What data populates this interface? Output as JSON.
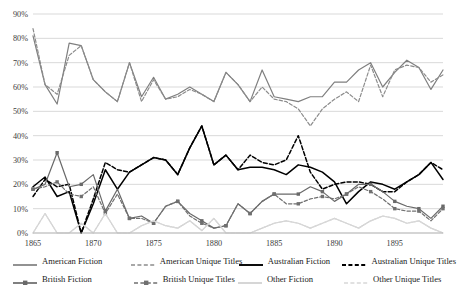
{
  "chart_data": {
    "type": "line",
    "title": "",
    "subtitle": "",
    "xlabel": "",
    "ylabel": "",
    "xlim": [
      1865,
      1899
    ],
    "ylim": [
      0,
      90
    ],
    "grid": true,
    "gridlines": "horizontal",
    "legend_position": "bottom",
    "y_ticks": [
      "0%",
      "10%",
      "20%",
      "30%",
      "40%",
      "50%",
      "60%",
      "70%",
      "80%",
      "90%"
    ],
    "y_tick_values": [
      0,
      10,
      20,
      30,
      40,
      50,
      60,
      70,
      80,
      90
    ],
    "x_ticks": [
      "1865",
      "1870",
      "1875",
      "1880",
      "1885",
      "1890",
      "1895"
    ],
    "x_tick_values": [
      1865,
      1870,
      1875,
      1880,
      1885,
      1890,
      1895
    ],
    "x": [
      1865,
      1866,
      1867,
      1868,
      1869,
      1870,
      1871,
      1872,
      1873,
      1874,
      1875,
      1876,
      1877,
      1878,
      1879,
      1880,
      1881,
      1882,
      1883,
      1884,
      1885,
      1886,
      1887,
      1888,
      1889,
      1890,
      1891,
      1892,
      1893,
      1894,
      1895,
      1896,
      1897,
      1898,
      1899
    ],
    "series": [
      {
        "name": "American Fiction",
        "color": "#7f7f7f",
        "style": "solid",
        "marker": "none",
        "values": [
          81,
          61,
          53,
          78,
          77,
          63,
          58,
          54,
          70,
          56,
          64,
          55,
          57,
          60,
          57,
          54,
          66,
          61,
          54,
          67,
          56,
          55,
          54,
          56,
          56,
          62,
          62,
          67,
          70,
          60,
          66,
          71,
          68,
          59,
          67
        ]
      },
      {
        "name": "American Unique Titles",
        "color": "#8c8c8c",
        "style": "dashed",
        "marker": "none",
        "values": [
          84,
          61,
          57,
          73,
          77,
          63,
          58,
          54,
          70,
          54,
          63,
          55,
          56,
          59,
          57,
          54,
          66,
          61,
          54,
          60,
          55,
          54,
          51,
          44,
          51,
          55,
          58,
          54,
          69,
          56,
          67,
          69,
          68,
          62,
          65
        ]
      },
      {
        "name": "Australian Fiction",
        "color": "#000000",
        "style": "solid",
        "marker": "none",
        "values": [
          19,
          23,
          15,
          17,
          0,
          12,
          26,
          18,
          25,
          28,
          31,
          30,
          24,
          35,
          44,
          28,
          32,
          26,
          27,
          27,
          26,
          24,
          28,
          27,
          25,
          21,
          12,
          17,
          21,
          20,
          18,
          21,
          24,
          29,
          22
        ]
      },
      {
        "name": "Australian Unique Titles",
        "color": "#000000",
        "style": "dashed",
        "marker": "none",
        "values": [
          15,
          22,
          19,
          20,
          0,
          14,
          29,
          26,
          25,
          28,
          31,
          30,
          24,
          35,
          44,
          28,
          32,
          26,
          32,
          29,
          28,
          30,
          40,
          25,
          18,
          20,
          21,
          21,
          20,
          17,
          17,
          21,
          24,
          29,
          26
        ]
      },
      {
        "name": "British Fiction",
        "color": "#696969",
        "style": "solid",
        "marker": "square",
        "values": [
          18,
          20,
          33,
          19,
          20,
          24,
          9,
          18,
          6,
          7,
          4,
          11,
          13,
          8,
          5,
          2,
          3,
          12,
          8,
          13,
          16,
          16,
          16,
          19,
          17,
          13,
          16,
          20,
          20,
          17,
          13,
          11,
          10,
          6,
          11
        ]
      },
      {
        "name": "British Unique Titles",
        "color": "#707070",
        "style": "dashed",
        "marker": "square",
        "values": [
          18,
          19,
          21,
          16,
          15,
          19,
          8,
          16,
          6,
          6,
          4,
          11,
          13,
          7,
          4,
          2,
          3,
          12,
          8,
          13,
          16,
          12,
          12,
          14,
          15,
          14,
          16,
          19,
          17,
          14,
          10,
          9,
          9,
          5,
          10
        ]
      },
      {
        "name": "Other Fiction",
        "color": "#cfcfcf",
        "style": "solid",
        "marker": "none",
        "values": [
          0,
          8,
          0,
          0,
          4,
          0,
          8,
          0,
          0,
          3,
          5,
          3,
          2,
          5,
          1,
          6,
          0,
          0,
          0,
          2,
          4,
          5,
          4,
          2,
          4,
          6,
          4,
          2,
          5,
          7,
          6,
          4,
          5,
          2,
          0
        ]
      },
      {
        "name": "Other Unique Titles",
        "color": "#d8d8d8",
        "style": "dashed",
        "marker": "none",
        "values": [
          0,
          8,
          0,
          0,
          4,
          0,
          8,
          0,
          0,
          3,
          5,
          3,
          2,
          5,
          1,
          6,
          0,
          0,
          0,
          2,
          4,
          5,
          4,
          2,
          4,
          6,
          4,
          2,
          5,
          7,
          6,
          4,
          5,
          2,
          0
        ]
      }
    ]
  },
  "legend": {
    "rows": [
      [
        {
          "label": "American Fiction",
          "color": "#7f7f7f",
          "style": "solid",
          "marker": "none"
        },
        {
          "label": "American Unique Titles",
          "color": "#8c8c8c",
          "style": "dashed",
          "marker": "none"
        },
        {
          "label": "Australian Fiction",
          "color": "#000000",
          "style": "solid",
          "marker": "none"
        },
        {
          "label": "Australian Unique Titles",
          "color": "#000000",
          "style": "dashed",
          "marker": "none"
        }
      ],
      [
        {
          "label": "British Fiction",
          "color": "#696969",
          "style": "solid",
          "marker": "square"
        },
        {
          "label": "British Unique Titles",
          "color": "#707070",
          "style": "dashed",
          "marker": "square"
        },
        {
          "label": "Other Fiction",
          "color": "#cfcfcf",
          "style": "solid",
          "marker": "none"
        },
        {
          "label": "Other Unique Titles",
          "color": "#d8d8d8",
          "style": "dashed",
          "marker": "none"
        }
      ]
    ]
  }
}
